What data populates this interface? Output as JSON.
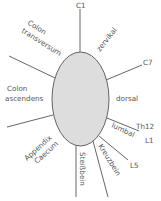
{
  "diagram": {
    "title": "",
    "colors": {
      "ellipse_fill": "#dddddd",
      "stroke": "#555555",
      "text": "#555555"
    },
    "center_shape": "ellipse",
    "labels": {
      "c1": "C1",
      "zervikal": "zervikal",
      "c7": "C7",
      "dorsal": "dorsal",
      "th12": "Th12",
      "l1": "L1",
      "lumbal": "lumbal",
      "l5": "L5",
      "kreuzbein": "Kreuzbein",
      "steissbein": "Steißbein",
      "appendix": "Appendix",
      "caecum": "Caecum",
      "colon_asc_1": "Colon",
      "colon_asc_2": "ascendens",
      "colon_trans_1": "Colon",
      "colon_trans_2": "transversum"
    }
  }
}
